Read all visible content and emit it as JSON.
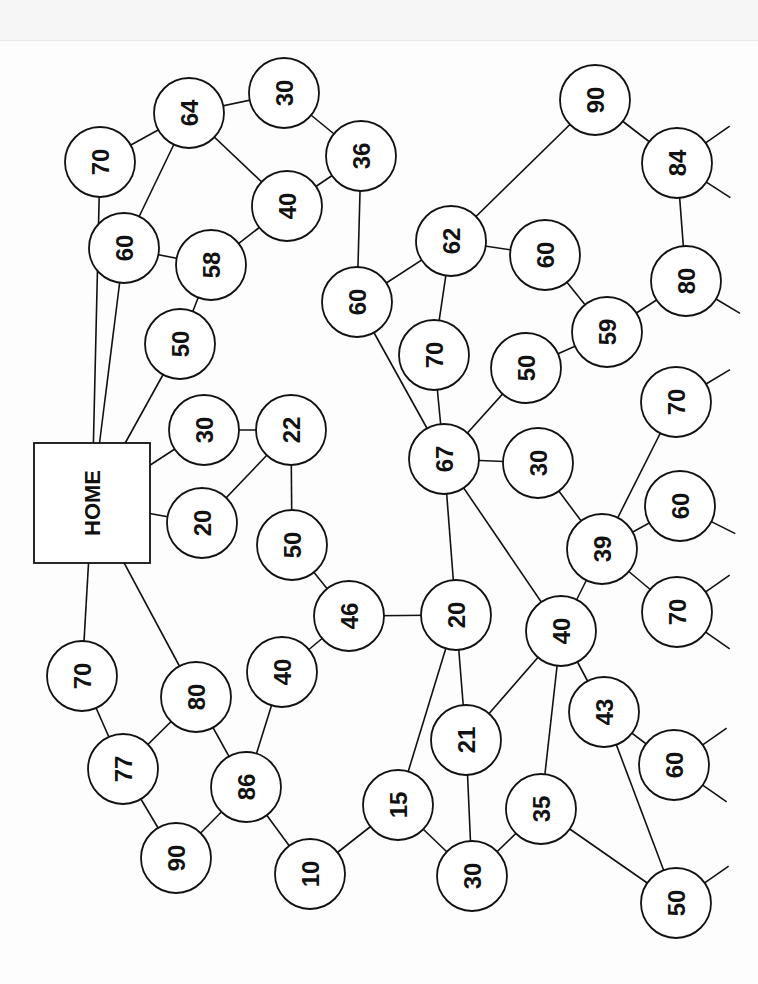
{
  "diagram": {
    "title": "",
    "home": {
      "id": "home",
      "label": "HOME",
      "x": 92,
      "y": 503,
      "w": 116,
      "h": 120
    },
    "nodes": [
      {
        "id": "n70a",
        "label": "70",
        "x": 100,
        "y": 162
      },
      {
        "id": "n64",
        "label": "64",
        "x": 189,
        "y": 113
      },
      {
        "id": "n30a",
        "label": "30",
        "x": 284,
        "y": 93
      },
      {
        "id": "n36",
        "label": "36",
        "x": 361,
        "y": 156
      },
      {
        "id": "n40a",
        "label": "40",
        "x": 287,
        "y": 206
      },
      {
        "id": "n60a",
        "label": "60",
        "x": 124,
        "y": 248
      },
      {
        "id": "n58",
        "label": "58",
        "x": 211,
        "y": 265
      },
      {
        "id": "n50a",
        "label": "50",
        "x": 180,
        "y": 344
      },
      {
        "id": "n60b",
        "label": "60",
        "x": 357,
        "y": 302
      },
      {
        "id": "n30b",
        "label": "30",
        "x": 204,
        "y": 430
      },
      {
        "id": "n22",
        "label": "22",
        "x": 291,
        "y": 430
      },
      {
        "id": "n20a",
        "label": "20",
        "x": 202,
        "y": 523
      },
      {
        "id": "n50b",
        "label": "50",
        "x": 292,
        "y": 545
      },
      {
        "id": "n46",
        "label": "46",
        "x": 349,
        "y": 616
      },
      {
        "id": "n40b",
        "label": "40",
        "x": 282,
        "y": 672
      },
      {
        "id": "n70b",
        "label": "70",
        "x": 82,
        "y": 676
      },
      {
        "id": "n80a",
        "label": "80",
        "x": 196,
        "y": 697
      },
      {
        "id": "n77",
        "label": "77",
        "x": 123,
        "y": 769
      },
      {
        "id": "n86",
        "label": "86",
        "x": 246,
        "y": 787
      },
      {
        "id": "n90a",
        "label": "90",
        "x": 176,
        "y": 858
      },
      {
        "id": "n10",
        "label": "10",
        "x": 310,
        "y": 874
      },
      {
        "id": "n15",
        "label": "15",
        "x": 398,
        "y": 805
      },
      {
        "id": "n62",
        "label": "62",
        "x": 451,
        "y": 241
      },
      {
        "id": "n60c",
        "label": "60",
        "x": 545,
        "y": 255
      },
      {
        "id": "n90b",
        "label": "90",
        "x": 595,
        "y": 100
      },
      {
        "id": "n84",
        "label": "84",
        "x": 677,
        "y": 163
      },
      {
        "id": "n80b",
        "label": "80",
        "x": 686,
        "y": 281
      },
      {
        "id": "n59",
        "label": "59",
        "x": 607,
        "y": 332
      },
      {
        "id": "n70c",
        "label": "70",
        "x": 434,
        "y": 355
      },
      {
        "id": "n50c",
        "label": "50",
        "x": 526,
        "y": 368
      },
      {
        "id": "n70d",
        "label": "70",
        "x": 676,
        "y": 402
      },
      {
        "id": "n67",
        "label": "67",
        "x": 444,
        "y": 459
      },
      {
        "id": "n30c",
        "label": "30",
        "x": 538,
        "y": 463
      },
      {
        "id": "n60d",
        "label": "60",
        "x": 680,
        "y": 506
      },
      {
        "id": "n39",
        "label": "39",
        "x": 602,
        "y": 549
      },
      {
        "id": "n70e",
        "label": "70",
        "x": 677,
        "y": 612
      },
      {
        "id": "n20b",
        "label": "20",
        "x": 456,
        "y": 615
      },
      {
        "id": "n40c",
        "label": "40",
        "x": 561,
        "y": 631
      },
      {
        "id": "n43",
        "label": "43",
        "x": 604,
        "y": 712
      },
      {
        "id": "n60e",
        "label": "60",
        "x": 674,
        "y": 765
      },
      {
        "id": "n21",
        "label": "21",
        "x": 466,
        "y": 740
      },
      {
        "id": "n35",
        "label": "35",
        "x": 541,
        "y": 809
      },
      {
        "id": "n30d",
        "label": "30",
        "x": 472,
        "y": 876
      },
      {
        "id": "n50d",
        "label": "50",
        "x": 676,
        "y": 903
      }
    ],
    "edges": [
      [
        "home",
        "n70a"
      ],
      [
        "home",
        "n60a"
      ],
      [
        "home",
        "n50a"
      ],
      [
        "home",
        "n30b"
      ],
      [
        "home",
        "n20a"
      ],
      [
        "home",
        "n70b"
      ],
      [
        "home",
        "n80a"
      ],
      [
        "n70a",
        "n64"
      ],
      [
        "n64",
        "n30a"
      ],
      [
        "n64",
        "n60a"
      ],
      [
        "n64",
        "n40a"
      ],
      [
        "n30a",
        "n36"
      ],
      [
        "n36",
        "n40a"
      ],
      [
        "n36",
        "n60b"
      ],
      [
        "n60a",
        "n58"
      ],
      [
        "n58",
        "n40a"
      ],
      [
        "n58",
        "n50a"
      ],
      [
        "n30b",
        "n22"
      ],
      [
        "n22",
        "n20a"
      ],
      [
        "n22",
        "n50b"
      ],
      [
        "n50b",
        "n46"
      ],
      [
        "n46",
        "n40b"
      ],
      [
        "n46",
        "n20b"
      ],
      [
        "n40b",
        "n86"
      ],
      [
        "n80a",
        "n86"
      ],
      [
        "n80a",
        "n77"
      ],
      [
        "n70b",
        "n77"
      ],
      [
        "n77",
        "n90a"
      ],
      [
        "n86",
        "n90a"
      ],
      [
        "n86",
        "n10"
      ],
      [
        "n10",
        "n15"
      ],
      [
        "n60b",
        "n62"
      ],
      [
        "n60b",
        "n67"
      ],
      [
        "n62",
        "n90b"
      ],
      [
        "n62",
        "n60c"
      ],
      [
        "n62",
        "n70c"
      ],
      [
        "n70c",
        "n67"
      ],
      [
        "n90b",
        "n84"
      ],
      [
        "n84",
        "n80b"
      ],
      [
        "n80b",
        "n59"
      ],
      [
        "n60c",
        "n59"
      ],
      [
        "n59",
        "n50c"
      ],
      [
        "n50c",
        "n67"
      ],
      [
        "n67",
        "n30c"
      ],
      [
        "n67",
        "n20b"
      ],
      [
        "n67",
        "n40c"
      ],
      [
        "n30c",
        "n39"
      ],
      [
        "n39",
        "n70d"
      ],
      [
        "n39",
        "n60d"
      ],
      [
        "n39",
        "n70e"
      ],
      [
        "n39",
        "n40c"
      ],
      [
        "n20b",
        "n15"
      ],
      [
        "n20b",
        "n21"
      ],
      [
        "n40c",
        "n21"
      ],
      [
        "n40c",
        "n35"
      ],
      [
        "n40c",
        "n43"
      ],
      [
        "n43",
        "n60e"
      ],
      [
        "n43",
        "n50d"
      ],
      [
        "n21",
        "n30d"
      ],
      [
        "n15",
        "n30d"
      ],
      [
        "n30d",
        "n35"
      ],
      [
        "n35",
        "n50d"
      ]
    ],
    "stubs": [
      {
        "from": "n84",
        "dx": 40,
        "dy": -28
      },
      {
        "from": "n84",
        "dx": 40,
        "dy": 26
      },
      {
        "from": "n80b",
        "dx": 40,
        "dy": 24
      },
      {
        "from": "n70d",
        "dx": 40,
        "dy": -24
      },
      {
        "from": "n60d",
        "dx": 40,
        "dy": 20
      },
      {
        "from": "n70e",
        "dx": 40,
        "dy": -28
      },
      {
        "from": "n70e",
        "dx": 40,
        "dy": 28
      },
      {
        "from": "n60e",
        "dx": 40,
        "dy": -28
      },
      {
        "from": "n60e",
        "dx": 40,
        "dy": 28
      },
      {
        "from": "n50d",
        "dx": 40,
        "dy": -28
      }
    ],
    "node_radius": 35
  }
}
